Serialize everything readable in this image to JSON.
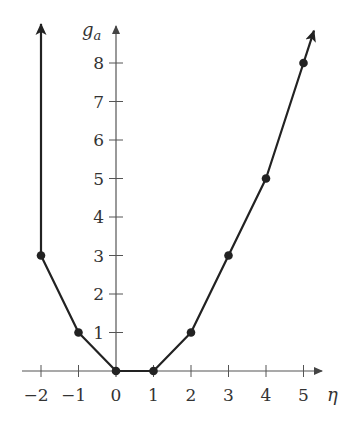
{
  "chart_data": {
    "type": "line",
    "title": "",
    "xlabel": "η",
    "ylabel": "g_a",
    "ylabel_base": "g",
    "ylabel_sub": "a",
    "x": [
      -2,
      -1,
      0,
      1,
      2,
      3,
      4,
      5
    ],
    "values": [
      3,
      1,
      0,
      0,
      1,
      3,
      5,
      8
    ],
    "series": [
      {
        "name": "g_a",
        "x": [
          -2,
          -1,
          0,
          1,
          2,
          3,
          4,
          5
        ],
        "values": [
          3,
          1,
          0,
          0,
          1,
          3,
          5,
          8
        ]
      }
    ],
    "x_ticks": [
      -2,
      -1,
      0,
      1,
      2,
      3,
      4,
      5
    ],
    "x_tick_labels": [
      "−2",
      "−1",
      "0",
      "1",
      "2",
      "3",
      "4",
      "5"
    ],
    "y_ticks": [
      1,
      2,
      3,
      4,
      5,
      6,
      7,
      8
    ],
    "y_tick_labels": [
      "1",
      "2",
      "3",
      "4",
      "5",
      "6",
      "7",
      "8"
    ],
    "xlim": [
      -2.4,
      5.6
    ],
    "ylim": [
      0,
      9
    ],
    "grid": false,
    "legend": "none",
    "annotations": [
      "left end continues upward (arrow at x=-2)",
      "right end continues upward (arrow beyond x=5)"
    ],
    "colors": {
      "line": "#222222",
      "axis": "#555555",
      "text": "#333333"
    }
  }
}
